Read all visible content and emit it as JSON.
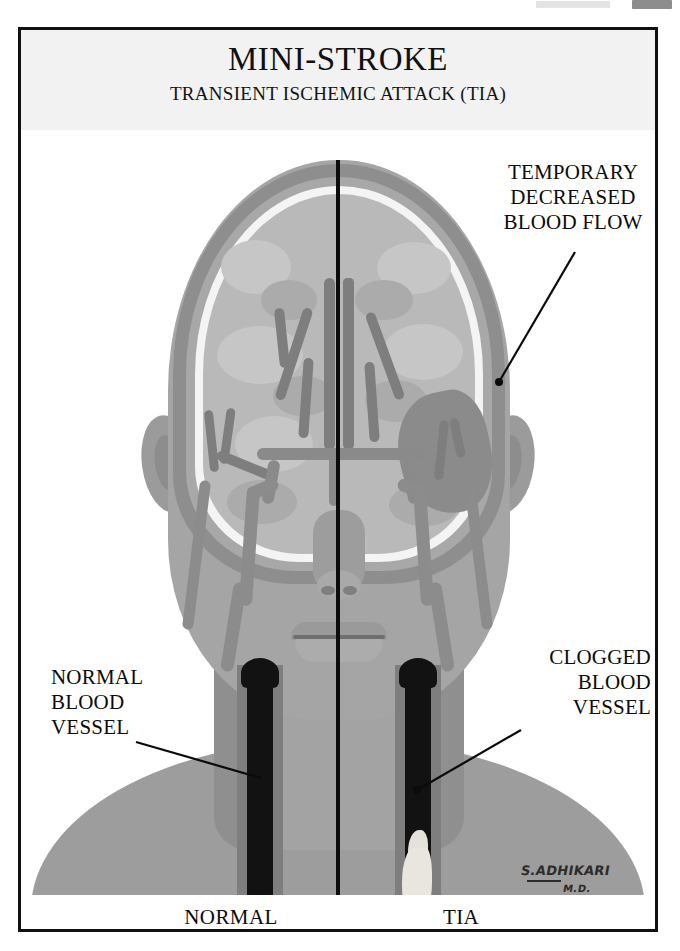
{
  "poster": {
    "title": "MINI-STROKE",
    "subtitle": "TRANSIENT ISCHEMIC ATTACK (TIA)",
    "border_color": "#111111",
    "title_background": "#f2f2f2"
  },
  "annotations": {
    "temporary_decreased_blood_flow": "TEMPORARY\nDECREASED\nBLOOD FLOW",
    "temporary_line1": "TEMPORARY",
    "temporary_line2": "DECREASED",
    "temporary_line3": "BLOOD FLOW",
    "normal_vessel_line1": "NORMAL",
    "normal_vessel_line2": "BLOOD",
    "normal_vessel_line3": "VESSEL",
    "clogged_vessel_line1": "CLOGGED",
    "clogged_vessel_line2": "BLOOD",
    "clogged_vessel_line3": "VESSEL"
  },
  "comparison": {
    "left_label": "NORMAL",
    "right_label": "TIA"
  },
  "signature": {
    "name": "S.ADHIKARI",
    "credential": "M.D."
  },
  "palette": {
    "ink": "#0b0b0b",
    "skin": "#a5a5a5",
    "shoulder": "#9d9d9d",
    "skull_outer": "#8e8e8e",
    "skull_inner": "#a8a8a8",
    "csf": "#f4f4f4",
    "brain": "#b9b9b9",
    "vessel": "#8a8a8a",
    "ischemic_region": "#8b8b8b",
    "lumen": "#121212",
    "plaque": "#e8e6df"
  }
}
